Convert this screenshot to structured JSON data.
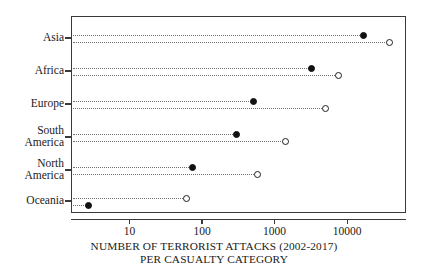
{
  "chart_data": {
    "type": "scatter",
    "title": "",
    "subtitle": "",
    "xlabel_line1": "NUMBER OF TERRORIST ATTACKS (2002-2017)",
    "xlabel_line2": "PER CASUALTY CATEGORY",
    "ylabel": "",
    "xscale": "log",
    "xlim": [
      2,
      60000
    ],
    "xticks": [
      10,
      100,
      1000,
      10000
    ],
    "xtick_labels": [
      "10",
      "100",
      "1000",
      "10000"
    ],
    "grid": false,
    "legend": "none",
    "categories": [
      "Asia",
      "Africa",
      "Europe",
      "South America",
      "North America",
      "Oceania"
    ],
    "series": [
      {
        "name": "filled-marker-series",
        "marker": "filled-circle",
        "values": [
          17000,
          3200,
          510,
          300,
          75,
          2.7
        ]
      },
      {
        "name": "open-marker-series",
        "marker": "open-circle",
        "values": [
          38000,
          7600,
          5100,
          1400,
          590,
          62
        ]
      }
    ],
    "points": [
      {
        "category": "Asia",
        "row": 0,
        "filled_value": 17000,
        "open_value": 38000,
        "filled_first": true
      },
      {
        "category": "Africa",
        "row": 1,
        "filled_value": 3200,
        "open_value": 7600,
        "filled_first": true
      },
      {
        "category": "Europe",
        "row": 2,
        "filled_value": 510,
        "open_value": 5100,
        "filled_first": true
      },
      {
        "category": "South America",
        "row": 3,
        "filled_value": 300,
        "open_value": 1400,
        "filled_first": true
      },
      {
        "category": "North America",
        "row": 4,
        "filled_value": 75,
        "open_value": 590,
        "filled_first": true
      },
      {
        "category": "Oceania",
        "row": 5,
        "filled_value": 2.7,
        "open_value": 62,
        "filled_first": false
      }
    ]
  },
  "axis": {
    "tick_labels": [
      "10",
      "100",
      "1000",
      "10000"
    ]
  },
  "y_labels": [
    {
      "text": "Asia"
    },
    {
      "text": "Africa"
    },
    {
      "text": "Europe"
    },
    {
      "text": "South\nAmerica"
    },
    {
      "text": "North\nAmerica"
    },
    {
      "text": "Oceania"
    }
  ],
  "colors": {
    "frame": "#3a3a3a",
    "filled_marker": "#111111",
    "open_marker_stroke": "#1f1f1f",
    "dotted_line": "#6e6e6e",
    "text": "#1a1a1a",
    "background": "#ffffff"
  }
}
